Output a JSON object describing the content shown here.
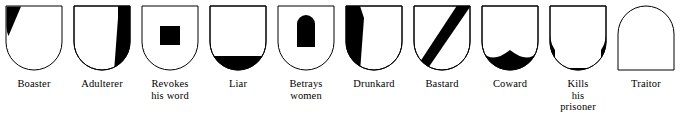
{
  "figure": {
    "kind": "heraldic-abatements-chart",
    "background_color": "#ffffff",
    "outline_color": "#000000",
    "charge_color": "#000000",
    "shields": [
      {
        "id": "boaster",
        "label": "Boaster",
        "mark_name": "dexter-chief-wedge",
        "mark_description": "black triangular wedge in upper left (dexter chief) corner"
      },
      {
        "id": "adulterer",
        "label": "Adulterer",
        "mark_name": "sinister-flank-band",
        "mark_description": "black vertical band along the right (sinister) flank"
      },
      {
        "id": "revokes-his-word",
        "label": "Revokes\nhis word",
        "mark_name": "center-square",
        "mark_description": "black square in the centre of the field"
      },
      {
        "id": "liar",
        "label": "Liar",
        "mark_name": "base-band",
        "mark_description": "black band across the curved base"
      },
      {
        "id": "betrays-women",
        "label": "Betrays\nwomen",
        "mark_name": "center-arch",
        "mark_description": "black arch with rounded top in the centre"
      },
      {
        "id": "drunkard",
        "label": "Drunkard",
        "mark_name": "dexter-flank-band",
        "mark_description": "black vertical band along the left (dexter) flank"
      },
      {
        "id": "bastard",
        "label": "Bastard",
        "mark_name": "bend-sinister",
        "mark_description": "black diagonal bend running from lower left to upper right"
      },
      {
        "id": "coward",
        "label": "Coward",
        "mark_name": "base-double-lobe",
        "mark_description": "black base with a scalloped two-lobed upper edge"
      },
      {
        "id": "kills-his-prisoner",
        "label": "Kills\nhis\nprisoner",
        "mark_name": "base-crescent",
        "mark_description": "black crescent hugging the curved base"
      },
      {
        "id": "traitor",
        "label": "Traitor",
        "mark_name": "reversed-shield",
        "mark_description": "plain shield turned upside down, rounded top and flat base"
      }
    ]
  }
}
